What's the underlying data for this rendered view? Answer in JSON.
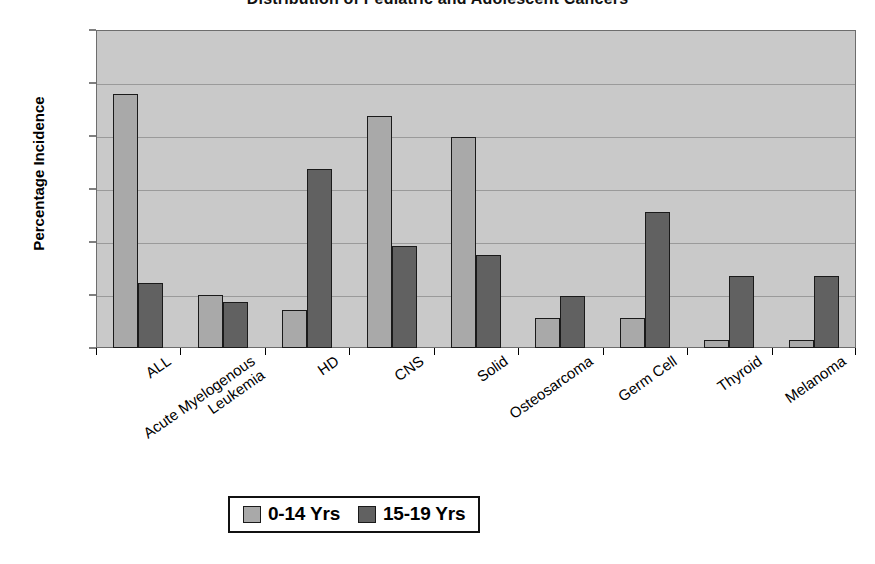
{
  "chart_data": {
    "type": "bar",
    "title": "Distribution of Pediatric and Adolescent Cancers",
    "xlabel": "",
    "ylabel": "Percentage Incidence",
    "ylim": [
      0,
      30
    ],
    "ytick_values": [
      0,
      5,
      10,
      15,
      20,
      25,
      30
    ],
    "ytick_labels": [
      "0",
      "5",
      "10",
      "15",
      "20",
      "25",
      "30"
    ],
    "grid": "horizontal",
    "legend_position": "bottom-center",
    "plot_background": "#c9c9c9",
    "categories": [
      "ALL",
      "Acute Myelogenous Leukemia",
      "HD",
      "CNS",
      "Solid",
      "Osteosarcoma",
      "Germ Cell",
      "Thyroid",
      "Melanoma"
    ],
    "category_lines": [
      [
        "ALL"
      ],
      [
        "Acute Myelogenous",
        "Leukemia"
      ],
      [
        "HD"
      ],
      [
        "CNS"
      ],
      [
        "Solid"
      ],
      [
        "Osteosarcoma"
      ],
      [
        "Germ Cell"
      ],
      [
        "Thyroid"
      ],
      [
        "Melanoma"
      ]
    ],
    "series": [
      {
        "name": "0-14 Yrs",
        "color": "#a9a9a9",
        "values": [
          24.0,
          5.0,
          3.6,
          21.9,
          19.9,
          2.8,
          2.8,
          0.8,
          0.8
        ]
      },
      {
        "name": "15-19 Yrs",
        "color": "#616161",
        "values": [
          6.1,
          4.3,
          16.9,
          9.6,
          8.8,
          4.9,
          12.8,
          6.8,
          6.8
        ]
      }
    ]
  },
  "legend": {
    "items": [
      {
        "label": "0-14 Yrs"
      },
      {
        "label": "15-19 Yrs"
      }
    ]
  }
}
